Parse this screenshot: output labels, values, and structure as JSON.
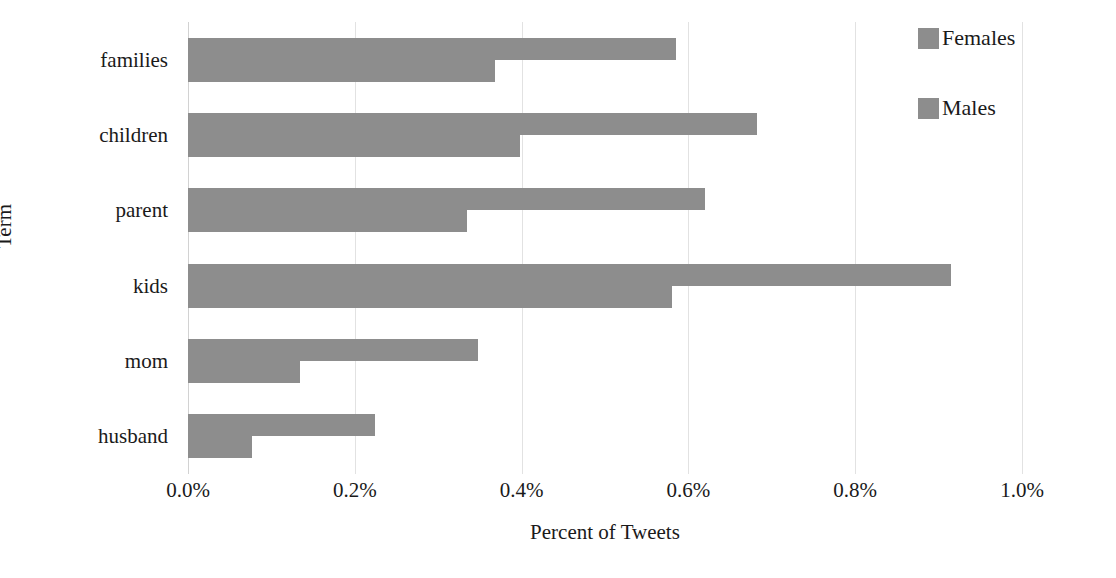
{
  "chart_data": {
    "type": "bar",
    "orientation": "horizontal",
    "title": "",
    "xlabel": "Percent of Tweets",
    "ylabel": "Term",
    "categories": [
      "families",
      "children",
      "parent",
      "kids",
      "mom",
      "husband"
    ],
    "series": [
      {
        "name": "Females",
        "color": "#8d8d8d",
        "values": [
          0.585,
          0.682,
          0.62,
          0.915,
          0.348,
          0.224
        ]
      },
      {
        "name": "Males",
        "color": "#8d8d8d",
        "values": [
          0.368,
          0.398,
          0.335,
          0.58,
          0.134,
          0.077
        ]
      }
    ],
    "xlim": [
      0,
      1.0
    ],
    "xticks": [
      0,
      0.2,
      0.4,
      0.6,
      0.8,
      1.0
    ],
    "xtick_labels": [
      "0.0%",
      "0.2%",
      "0.4%",
      "0.6%",
      "0.8%",
      "1.0%"
    ],
    "value_unit": "%",
    "grid": "vertical",
    "legend_position": "top-right"
  },
  "axes": {
    "x_title": "Percent of Tweets",
    "y_title": "Term"
  },
  "legend": {
    "entries": [
      {
        "label": "Females"
      },
      {
        "label": "Males"
      }
    ]
  },
  "colors": {
    "bar": "#8d8d8d",
    "grid": "#e2e2e2",
    "text": "#1a1a1a",
    "background": "#ffffff"
  }
}
